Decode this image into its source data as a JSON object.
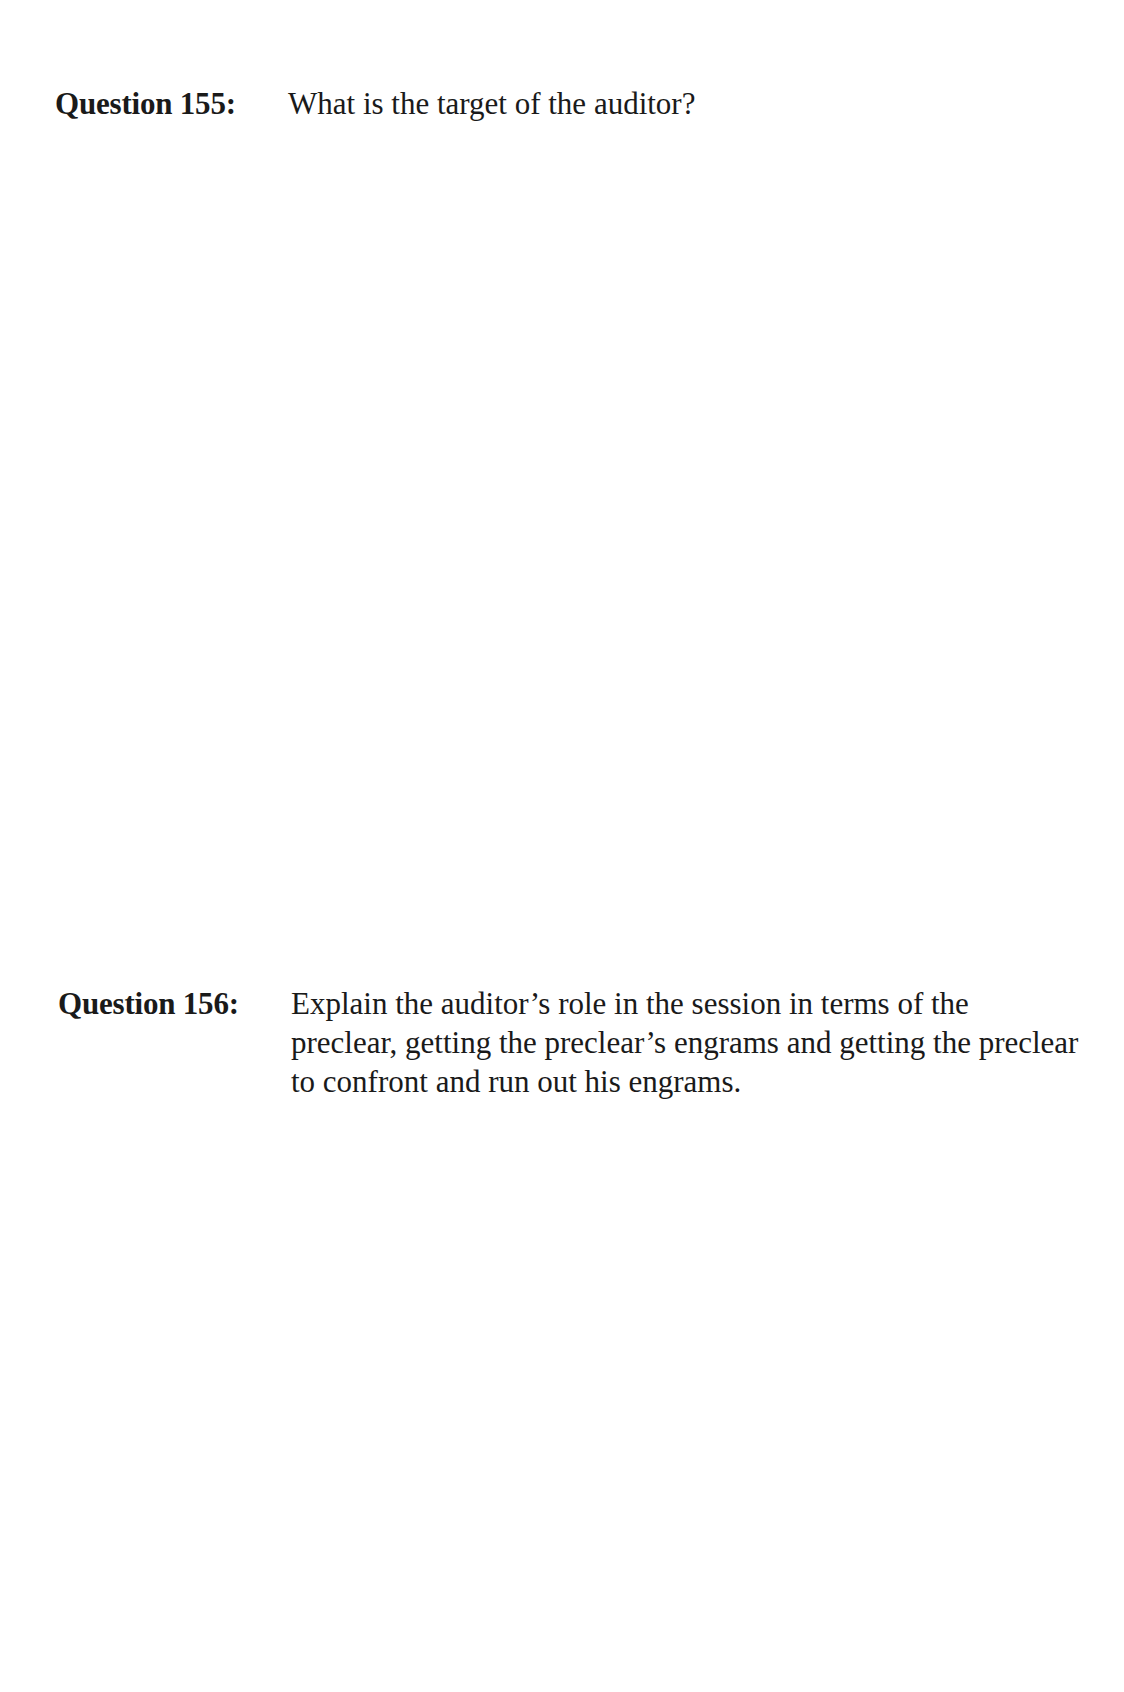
{
  "questions": [
    {
      "label": "Question 155:",
      "text": "What is the target of the auditor?"
    },
    {
      "label": "Question 156:",
      "text": "Explain the auditor’s role in the session in terms of the preclear, getting the preclear’s engrams and getting the preclear to confront and run out his engrams."
    }
  ]
}
